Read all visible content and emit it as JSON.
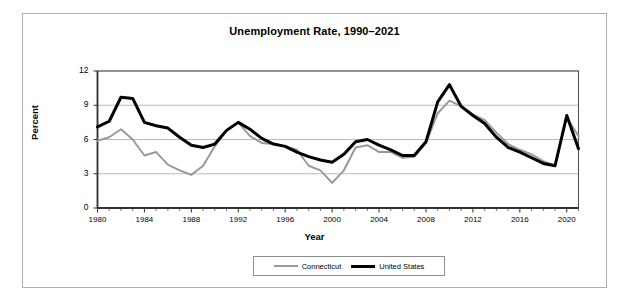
{
  "chart_data": {
    "type": "line",
    "title": "Unemployment Rate, 1990–2021",
    "xlabel": "Year",
    "ylabel": "Percent",
    "xlim": [
      1980,
      2021
    ],
    "ylim": [
      0,
      12
    ],
    "ytick_labels": [
      "0",
      "3",
      "6",
      "9",
      "12"
    ],
    "yticks": [
      0,
      3,
      6,
      9,
      12
    ],
    "xtick_labels": [
      "1980",
      "1984",
      "1988",
      "1992",
      "1996",
      "2000",
      "2004",
      "2008",
      "2012",
      "2016",
      "2020"
    ],
    "xticks": [
      1980,
      1984,
      1988,
      1992,
      1996,
      2000,
      2004,
      2008,
      2012,
      2016,
      2020
    ],
    "grid": "horizontal",
    "legend_position": "bottom-center",
    "x": [
      1980,
      1981,
      1982,
      1983,
      1984,
      1985,
      1986,
      1987,
      1988,
      1989,
      1990,
      1991,
      1992,
      1993,
      1994,
      1995,
      1996,
      1997,
      1998,
      1999,
      2000,
      2001,
      2002,
      2003,
      2004,
      2005,
      2006,
      2007,
      2008,
      2009,
      2010,
      2011,
      2012,
      2013,
      2014,
      2015,
      2016,
      2017,
      2018,
      2019,
      2020,
      2021
    ],
    "series": [
      {
        "name": "Connecticut",
        "color": "#999999",
        "linewidth": 2,
        "values": [
          5.9,
          6.2,
          6.9,
          6.0,
          4.6,
          4.9,
          3.8,
          3.3,
          2.9,
          3.7,
          5.4,
          6.8,
          7.5,
          6.3,
          5.7,
          5.6,
          5.4,
          5.1,
          3.7,
          3.3,
          2.2,
          3.3,
          5.3,
          5.5,
          4.9,
          4.9,
          4.4,
          4.5,
          5.7,
          8.3,
          9.4,
          8.9,
          8.2,
          7.7,
          6.6,
          5.6,
          5.1,
          4.7,
          4.1,
          3.7,
          7.9,
          6.3
        ]
      },
      {
        "name": "United States",
        "color": "#000000",
        "linewidth": 3,
        "values": [
          7.1,
          7.6,
          9.7,
          9.6,
          7.5,
          7.2,
          7.0,
          6.2,
          5.5,
          5.3,
          5.6,
          6.8,
          7.5,
          6.9,
          6.1,
          5.6,
          5.4,
          4.9,
          4.5,
          4.2,
          4.0,
          4.7,
          5.8,
          6.0,
          5.5,
          5.1,
          4.6,
          4.6,
          5.8,
          9.3,
          10.8,
          8.9,
          8.1,
          7.4,
          6.2,
          5.3,
          4.9,
          4.4,
          3.9,
          3.7,
          8.1,
          5.2
        ]
      }
    ]
  },
  "legend": {
    "items": [
      {
        "label": "Connecticut"
      },
      {
        "label": "United States"
      }
    ]
  }
}
